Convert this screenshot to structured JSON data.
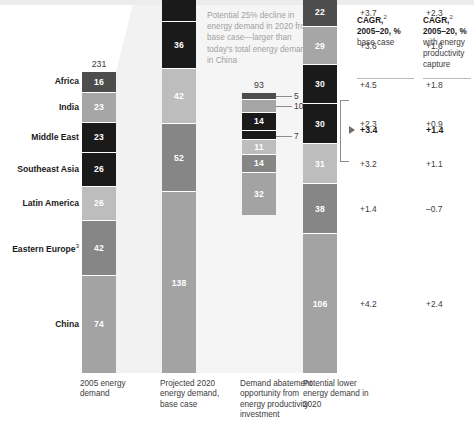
{
  "annotation": {
    "text": "Potential 25% decline in energy demand in 2020 from base case—larger than today's total energy demand in China"
  },
  "cagr_headers": [
    {
      "title": "CAGR,",
      "sup": "2",
      "period": "2005–20, %",
      "sub": "base case"
    },
    {
      "title": "CAGR,",
      "sup": "2",
      "period": "2005–20, %",
      "sub": "with energy productivity capture"
    }
  ],
  "row_labels": [
    {
      "label": "Africa",
      "sup": ""
    },
    {
      "label": "India",
      "sup": ""
    },
    {
      "label": "Middle East",
      "sup": ""
    },
    {
      "label": "Southeast Asia",
      "sup": ""
    },
    {
      "label": "Latin America",
      "sup": ""
    },
    {
      "label": "Eastern Europe",
      "sup": "3"
    },
    {
      "label": "China",
      "sup": ""
    }
  ],
  "x_captions": [
    "2005 energy demand",
    "Projected 2020 energy demand, base case",
    "Demand abatement opportunity from energy productivity investment",
    "Potential lower energy demand in 2020"
  ],
  "cagr_base_case": {
    "total": "+3.4",
    "values": [
      "+3.7",
      "+3.6",
      "+4.5",
      "+2.3",
      "+3.2",
      "+1.4",
      "",
      "+4.2"
    ]
  },
  "cagr_with_capture": {
    "total": "+1.4",
    "values": [
      "+2.3",
      "+1.6",
      "+1.8",
      "+0.9",
      "+1.1",
      "–0.7",
      "",
      "+2.4"
    ]
  },
  "chart_data": {
    "type": "bar",
    "title": "",
    "subtitle": "",
    "xlabel": "",
    "ylabel": "",
    "stacked": true,
    "categories": [
      "2005 energy demand",
      "Projected 2020 energy demand, base case",
      "Demand abatement opportunity from energy productivity investment",
      "Potential lower energy demand in 2020"
    ],
    "series": [
      {
        "name": "Africa",
        "values": [
          16,
          27,
          5,
          22
        ]
      },
      {
        "name": "India",
        "values": [
          23,
          29,
          10,
          29
        ]
      },
      {
        "name": "Middle East",
        "values": [
          23,
          45,
          14,
          30
        ]
      },
      {
        "name": "Southeast Asia",
        "values": [
          26,
          36,
          7,
          30
        ]
      },
      {
        "name": "Latin America",
        "values": [
          26,
          42,
          11,
          31
        ]
      },
      {
        "name": "Eastern Europe",
        "values": [
          42,
          52,
          14,
          38
        ]
      },
      {
        "name": "China",
        "values": [
          74,
          138,
          32,
          106
        ]
      }
    ],
    "totals": [
      231,
      380,
      93,
      287
    ],
    "units": "quadrillion BTU"
  },
  "column_totals": {
    "c1": "231",
    "c2": "380",
    "c3": "93",
    "c4": "287"
  },
  "col1_segments": [
    {
      "v": "16",
      "color": "#4d4d4d",
      "fg": "#ffffff"
    },
    {
      "v": "23",
      "color": "#a6a6a6",
      "fg": "#ffffff"
    },
    {
      "v": "23",
      "color": "#1a1a1a",
      "fg": "#ffffff"
    },
    {
      "v": "26",
      "color": "#1a1a1a",
      "fg": "#ffffff"
    },
    {
      "v": "26",
      "color": "#bdbdbd",
      "fg": "#ffffff"
    },
    {
      "v": "42",
      "color": "#868686",
      "fg": "#ffffff"
    },
    {
      "v": "74",
      "color": "#a3a3a3",
      "fg": "#ffffff"
    }
  ],
  "col2_segments": [
    {
      "v": "27",
      "color": "#4d4d4d",
      "fg": "#ffffff"
    },
    {
      "v": "29",
      "color": "#a6a6a6",
      "fg": "#ffffff"
    },
    {
      "v": "45",
      "color": "#1a1a1a",
      "fg": "#ffffff"
    },
    {
      "v": "36",
      "color": "#1a1a1a",
      "fg": "#ffffff"
    },
    {
      "v": "42",
      "color": "#bdbdbd",
      "fg": "#ffffff"
    },
    {
      "v": "52",
      "color": "#868686",
      "fg": "#ffffff"
    },
    {
      "v": "138",
      "color": "#a3a3a3",
      "fg": "#ffffff"
    }
  ],
  "col3_segments": [
    {
      "v": "5",
      "color": "#4d4d4d",
      "fg": "#ffffff",
      "outside": true
    },
    {
      "v": "10",
      "color": "#a6a6a6",
      "fg": "#ffffff",
      "outside": true
    },
    {
      "v": "14",
      "color": "#1a1a1a",
      "fg": "#ffffff",
      "outside": false
    },
    {
      "v": "7",
      "color": "#1a1a1a",
      "fg": "#ffffff",
      "outside": true
    },
    {
      "v": "11",
      "color": "#bdbdbd",
      "fg": "#ffffff",
      "outside": false
    },
    {
      "v": "14",
      "color": "#868686",
      "fg": "#ffffff",
      "outside": false
    },
    {
      "v": "32",
      "color": "#a3a3a3",
      "fg": "#ffffff",
      "outside": false
    }
  ],
  "col4_segments": [
    {
      "v": "22",
      "color": "#4d4d4d",
      "fg": "#ffffff"
    },
    {
      "v": "29",
      "color": "#a6a6a6",
      "fg": "#ffffff"
    },
    {
      "v": "30",
      "color": "#1a1a1a",
      "fg": "#ffffff"
    },
    {
      "v": "30",
      "color": "#1a1a1a",
      "fg": "#ffffff"
    },
    {
      "v": "31",
      "color": "#bdbdbd",
      "fg": "#ffffff"
    },
    {
      "v": "38",
      "color": "#868686",
      "fg": "#ffffff"
    },
    {
      "v": "106",
      "color": "#a3a3a3",
      "fg": "#ffffff"
    }
  ],
  "colors": {
    "text": "#231f20",
    "muted": "#3c3c3c",
    "rule": "#b9b9b9",
    "connector": "#ededed"
  }
}
